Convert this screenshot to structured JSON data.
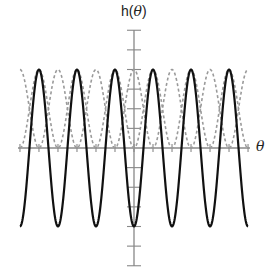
{
  "chart_data": {
    "type": "line",
    "title": "",
    "xlabel": "θ",
    "ylabel": "h(θ)",
    "ylabel_prefix": "h(",
    "ylabel_var": "θ",
    "ylabel_suffix": ")",
    "xlim": [
      -9.4248,
      9.4248
    ],
    "ylim": [
      -1.5,
      1.5
    ],
    "x_ticks_step": 1.5708,
    "y_ticks_step": 0.25,
    "x_tick_labels": [],
    "y_tick_labels": [],
    "grid": false,
    "legend": null,
    "series": [
      {
        "name": "sin²θ − cos²θ",
        "expr": "-cos(2θ)",
        "style": "solid",
        "color": "#111111",
        "width": 2.2
      },
      {
        "name": "cos²θ",
        "expr": "cos(θ)^2",
        "style": "dashed",
        "color": "#9a9a9a",
        "width": 1.6
      },
      {
        "name": "sin²θ",
        "expr": "sin(θ)^2",
        "style": "dashed",
        "color": "#9a9a9a",
        "width": 1.6
      }
    ],
    "sample_points": {
      "x": [
        -9.4248,
        -7.854,
        -6.2832,
        -4.7124,
        -3.1416,
        -1.5708,
        0,
        1.5708,
        3.1416,
        4.7124,
        6.2832,
        7.854,
        9.4248
      ],
      "solid": [
        -1,
        1,
        -1,
        1,
        -1,
        1,
        -1,
        1,
        -1,
        1,
        -1,
        1,
        -1
      ],
      "dashed_cos2": [
        1,
        0,
        1,
        0,
        1,
        0,
        1,
        0,
        1,
        0,
        1,
        0,
        1
      ],
      "dashed_sin2": [
        0,
        1,
        0,
        1,
        0,
        1,
        0,
        1,
        0,
        1,
        0,
        1,
        0
      ]
    }
  },
  "layout": {
    "origin_x": 134,
    "origin_y": 148,
    "px_per_x": 12.1,
    "px_per_y": 78.5,
    "x_axis_left": 18,
    "x_axis_right": 250,
    "y_axis_top": 30,
    "y_axis_bottom": 266,
    "axis_color": "#888888"
  }
}
